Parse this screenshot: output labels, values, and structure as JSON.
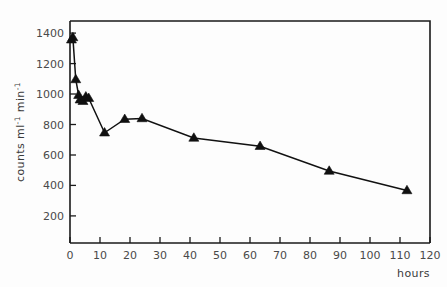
{
  "chart_data": {
    "type": "line",
    "title": "",
    "subtitle": "",
    "xlabel": "hours",
    "ylabel": "counts ml⁻¹ min⁻¹",
    "ylabel_parts": {
      "base1": "counts ml",
      "sup1": "-1",
      "base2": " min",
      "sup2": "-1"
    },
    "xlim": [
      0,
      125
    ],
    "ylim": [
      0,
      1480
    ],
    "grid": false,
    "legend": null,
    "x_ticks": [
      0,
      10,
      20,
      30,
      40,
      50,
      60,
      70,
      80,
      90,
      100,
      110,
      120
    ],
    "x_tick_labels": [
      "0",
      "10",
      "20",
      "30",
      "40",
      "50",
      "60",
      "70",
      "80",
      "90",
      "100",
      "110",
      "120"
    ],
    "y_ticks": [
      200,
      400,
      600,
      800,
      1000,
      1200,
      1400
    ],
    "y_tick_labels": [
      "200",
      "400",
      "600",
      "800",
      "1000",
      "1200",
      "1400"
    ],
    "marker": "triangle-up",
    "marker_color": "#101010",
    "line_color": "#111111",
    "series": [
      {
        "name": "counts",
        "x": [
          0.5,
          1.0,
          2.0,
          3.0,
          3.5,
          4.5,
          5.5,
          6.5,
          12.0,
          19.0,
          25.0,
          43.0,
          66.0,
          90.0,
          117.0
        ],
        "y": [
          1355,
          1370,
          1090,
          985,
          955,
          945,
          975,
          965,
          735,
          825,
          830,
          700,
          645,
          480,
          350
        ]
      }
    ],
    "annotations": []
  },
  "figure": {
    "background_color": "#fdfdfd",
    "axis_color": "#1a1a1a",
    "text_color": "#444444"
  }
}
